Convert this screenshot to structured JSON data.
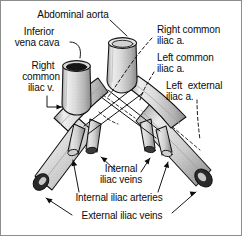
{
  "figure": {
    "style": "grayscale line drawing with stippled shading",
    "border_color": "#8d8d8d",
    "background_color": "#ffffff",
    "ink_color": "#0b0b0b"
  },
  "labels": {
    "abdominal_aorta": "Abdominal aorta",
    "inferior_vena_cava_line1": "Inferior",
    "inferior_vena_cava_line2": "vena cava",
    "right_common_iliac_v_line1": "Right",
    "right_common_iliac_v_line2": "common",
    "right_common_iliac_v_line3": "iliac v.",
    "right_common_iliac_a_line1": "Right common",
    "right_common_iliac_a_line2": "iliac a.",
    "left_common_iliac_a_line1": "Left common",
    "left_common_iliac_a_line2": "iliac a.",
    "left_external_iliac_a_line1": "Left  external",
    "left_external_iliac_a_line2": "iliac a.",
    "internal_iliac_veins_line1": "Internal",
    "internal_iliac_veins_line2": "iliac veins",
    "internal_iliac_arteries": "Internal iliac arteries",
    "external_iliac_veins": "External iliac veins"
  },
  "structures": [
    {
      "name": "abdominal-aorta",
      "type": "artery",
      "position": "center-superior",
      "cut_end": "open lumen, light"
    },
    {
      "name": "inferior-vena-cava",
      "type": "vein",
      "position": "left-superior",
      "cut_end": "open lumen, dark"
    },
    {
      "name": "right-common-iliac-vein",
      "type": "vein",
      "position": "left-upper-limb"
    },
    {
      "name": "left-common-iliac-vein",
      "type": "vein",
      "position": "right-descending-limb"
    },
    {
      "name": "right-common-iliac-artery",
      "type": "artery",
      "position": "crossing-left-to-right",
      "rendering": "dashed where hidden"
    },
    {
      "name": "left-common-iliac-artery",
      "type": "artery",
      "position": "crossing-right-to-left",
      "rendering": "dashed where hidden"
    },
    {
      "name": "left-external-iliac-artery",
      "type": "artery",
      "position": "right-inferior",
      "rendering": "dashed"
    },
    {
      "name": "internal-iliac-veins",
      "type": "vein",
      "count": 2,
      "position": "paired short medial stumps"
    },
    {
      "name": "internal-iliac-arteries",
      "type": "artery",
      "count": 2,
      "position": "paired short branches"
    },
    {
      "name": "external-iliac-veins",
      "type": "vein",
      "count": 2,
      "position": "inferolateral cut ends, dark lumen"
    }
  ],
  "leaders": [
    {
      "for": "abdominal_aorta",
      "style": "solid",
      "terminal": "none"
    },
    {
      "for": "inferior_vena_cava",
      "style": "solid-curved",
      "terminal": "none"
    },
    {
      "for": "right_common_iliac_v",
      "style": "solid-elbow",
      "terminal": "arrow"
    },
    {
      "for": "right_common_iliac_a",
      "style": "dashed",
      "terminal": "none"
    },
    {
      "for": "left_common_iliac_a",
      "style": "dashed",
      "terminal": "none"
    },
    {
      "for": "left_external_iliac_a",
      "style": "dashed",
      "terminal": "none"
    },
    {
      "for": "internal_iliac_veins",
      "style": "solid",
      "terminal": "arrow",
      "count": 2
    },
    {
      "for": "internal_iliac_arteries",
      "style": "solid",
      "terminal": "arrow",
      "count": 2
    },
    {
      "for": "external_iliac_veins",
      "style": "solid",
      "terminal": "arrow",
      "count": 2
    }
  ]
}
